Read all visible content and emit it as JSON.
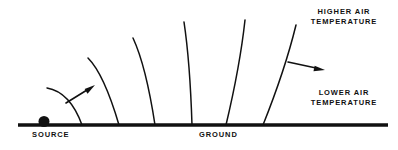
{
  "figure": {
    "background_color": "#ffffff",
    "ink_color": "#111111",
    "width": 398,
    "height": 150
  },
  "labels": {
    "source": "SOURCE",
    "ground": "GROUND",
    "higher_air_temperature": "HIGHER AIR\nTEMPERATURE",
    "lower_air_temperature": "LOWER AIR\nTEMPERATURE"
  },
  "chart_data": {
    "type": "diagram",
    "annotations": [
      "SOURCE",
      "GROUND",
      "HIGHER AIR TEMPERATURE",
      "LOWER AIR TEMPERATURE"
    ],
    "ground_line": {
      "x1": 18,
      "y1": 125,
      "x2": 388,
      "y2": 125,
      "thickness": 3
    },
    "source_marker": {
      "x": 44,
      "y": 122,
      "radius": 5.5,
      "shape": "filled-circle"
    },
    "wavefronts": [
      {
        "id": 1,
        "path": "M47,88 Q70,92 82,125"
      },
      {
        "id": 2,
        "path": "M88,58 Q104,74 119,125"
      },
      {
        "id": 3,
        "path": "M133,38 Q146,66 155,125"
      },
      {
        "id": 4,
        "path": "M184,22 Q190,62 192,125"
      },
      {
        "id": 5,
        "path": "M245,20 Q240,66 226,125"
      },
      {
        "id": 6,
        "path": "M296,25 Q285,70 263,125"
      }
    ],
    "arrows": [
      {
        "id": "left-arrow",
        "x1": 66,
        "y1": 103,
        "x2": 95,
        "y2": 85,
        "label": "propagation direction near source"
      },
      {
        "id": "right-arrow",
        "x1": 288,
        "y1": 62,
        "x2": 325,
        "y2": 70,
        "label": "propagation direction downwind"
      }
    ]
  }
}
